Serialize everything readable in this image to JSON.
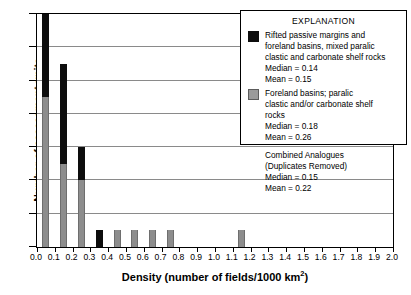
{
  "chart_data": {
    "type": "bar",
    "title": "",
    "xlabel": "Density (number of fields/1000 km2)",
    "xlabel_base": "Density (number of fields/1000 km",
    "xlabel_sup": "2",
    "xlabel_tail": ")",
    "ylabel": "Number of assessment units",
    "xlim": [
      0.0,
      2.0
    ],
    "ylim": [
      0,
      14
    ],
    "grid": true,
    "stacked": true,
    "legend_position": "top-right",
    "x_tick_labels": [
      "0.0",
      "0.1",
      "0.2",
      "0.3",
      "0.4",
      "0.5",
      "0.6",
      "0.7",
      "0.8",
      "0.9",
      "1.0",
      "1.1",
      "1.2",
      "1.3",
      "1.4",
      "1.5",
      "1.6",
      "1.7",
      "1.8",
      "1.9",
      "2.0"
    ],
    "x_tick_values": [
      0.0,
      0.1,
      0.2,
      0.3,
      0.4,
      0.5,
      0.6,
      0.7,
      0.8,
      0.9,
      1.0,
      1.1,
      1.2,
      1.3,
      1.4,
      1.5,
      1.6,
      1.7,
      1.8,
      1.9,
      2.0
    ],
    "y_tick_labels": [
      "0",
      "2",
      "4",
      "6",
      "8",
      "10",
      "12",
      "14"
    ],
    "y_tick_values": [
      0,
      2,
      4,
      6,
      8,
      10,
      12,
      14
    ],
    "gridline_values": [
      2,
      4,
      6,
      8,
      10,
      12
    ],
    "bin_width": 0.1,
    "series": [
      {
        "name": "Foreland basins; paralic clastic and/or carbonate shelf rocks",
        "color": "#8d8d8d",
        "values": [
          9,
          5,
          4,
          0,
          1,
          1,
          1,
          1,
          0,
          0,
          0,
          1
        ]
      },
      {
        "name": "Rifted passive margins and foreland basins, mixed paralic clastic and carbonate shelf rocks",
        "color": "#0d0d0d",
        "values": [
          5,
          6,
          2,
          1,
          0,
          0,
          0,
          0,
          0,
          0,
          0,
          0
        ]
      }
    ],
    "bars": [
      {
        "x": 0.05,
        "gray": 9,
        "black": 5,
        "total": 14
      },
      {
        "x": 0.15,
        "gray": 5,
        "black": 6,
        "total": 11
      },
      {
        "x": 0.25,
        "gray": 4,
        "black": 2,
        "total": 6
      },
      {
        "x": 0.35,
        "gray": 0,
        "black": 1,
        "total": 1
      },
      {
        "x": 0.45,
        "gray": 1,
        "black": 0,
        "total": 1
      },
      {
        "x": 0.55,
        "gray": 1,
        "black": 0,
        "total": 1
      },
      {
        "x": 0.65,
        "gray": 1,
        "black": 0,
        "total": 1
      },
      {
        "x": 0.75,
        "gray": 1,
        "black": 0,
        "total": 1
      },
      {
        "x": 1.15,
        "gray": 1,
        "black": 0,
        "total": 1
      }
    ]
  },
  "legend": {
    "title": "EXPLANATION",
    "entries": [
      {
        "swatch": "black",
        "lines": [
          "Rifted passive margins and",
          "foreland basins, mixed paralic",
          "clastic and carbonate shelf rocks",
          "Median = 0.14",
          "Mean = 0.15"
        ]
      },
      {
        "swatch": "gray",
        "lines": [
          "Foreland basins; paralic",
          "clastic and/or carbonate shelf",
          "rocks",
          "Median = 0.18",
          "Mean = 0.26"
        ]
      }
    ],
    "combined": {
      "lines": [
        "Combined Analogues",
        "(Duplicates Removed)",
        "Median = 0.15",
        "Mean = 0.22"
      ]
    }
  },
  "colors": {
    "black_series": "#0d0d0d",
    "gray_series": "#8d8d8d",
    "gridline": "#8a8a8a",
    "axis": "#000000",
    "background": "#ffffff"
  }
}
